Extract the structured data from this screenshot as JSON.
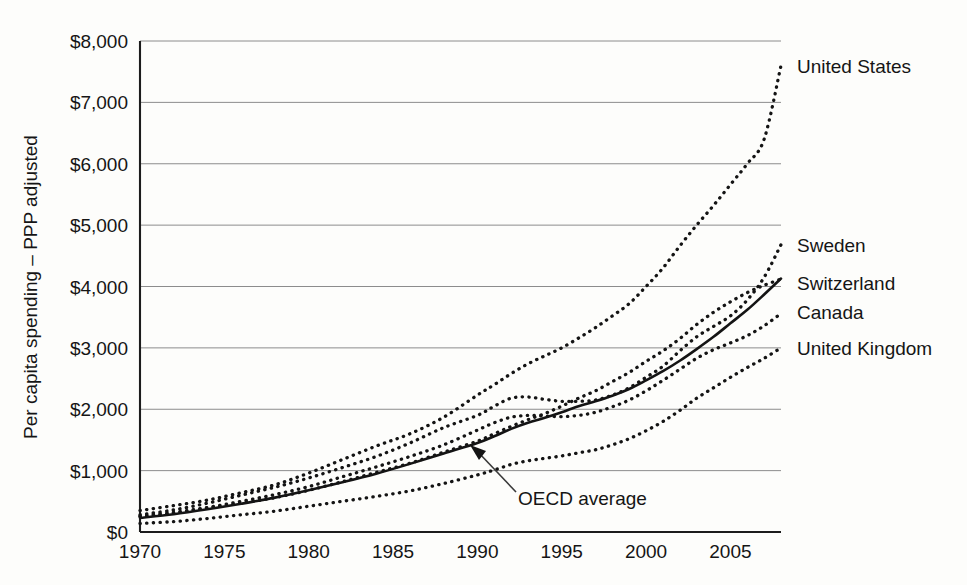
{
  "chart_data": {
    "type": "line",
    "title": "",
    "xlabel": "",
    "ylabel": "Per capita spending – PPP adjusted",
    "xlim": [
      1970,
      2008
    ],
    "ylim": [
      0,
      8000
    ],
    "grid": true,
    "legend_position": "right-inline",
    "y_tick_labels": [
      "$8,000",
      "$7,000",
      "$6,000",
      "$5,000",
      "$4,000",
      "$3,000",
      "$2,000",
      "$1,000",
      "$0"
    ],
    "y_tick_values": [
      8000,
      7000,
      6000,
      5000,
      4000,
      3000,
      2000,
      1000,
      0
    ],
    "x_tick_labels": [
      "1970",
      "1975",
      "1980",
      "1985",
      "1990",
      "1995",
      "2000",
      "2005"
    ],
    "x_tick_values": [
      1970,
      1975,
      1980,
      1985,
      1990,
      1995,
      2000,
      2005
    ],
    "x": [
      1970,
      1972,
      1974,
      1976,
      1978,
      1980,
      1982,
      1984,
      1986,
      1988,
      1990,
      1991,
      1992,
      1993,
      1994,
      1995,
      1996,
      1997,
      1998,
      1999,
      2000,
      2001,
      2002,
      2003,
      2004,
      2005,
      2006,
      2007,
      2008
    ],
    "annotations": [
      {
        "text": "OECD average",
        "x": 1989.2,
        "y": 1380
      }
    ],
    "series": [
      {
        "name": "United States",
        "style": "dotted",
        "label": "United States",
        "label_y": 7590,
        "values": [
          350,
          430,
          520,
          640,
          770,
          960,
          1180,
          1400,
          1600,
          1870,
          2230,
          2400,
          2580,
          2740,
          2870,
          3000,
          3160,
          3330,
          3520,
          3720,
          4000,
          4300,
          4660,
          5000,
          5320,
          5660,
          6000,
          6400,
          7600
        ]
      },
      {
        "name": "Sweden",
        "style": "dotted",
        "label": "Sweden",
        "label_y": 4670,
        "values": [
          280,
          360,
          470,
          600,
          730,
          880,
          1050,
          1230,
          1450,
          1700,
          1900,
          2050,
          2180,
          2200,
          2160,
          2130,
          2130,
          2150,
          2230,
          2350,
          2520,
          2700,
          2950,
          3180,
          3350,
          3520,
          3780,
          4150,
          4680
        ]
      },
      {
        "name": "Switzerland",
        "style": "dotted",
        "label": "Switzerland",
        "label_y": 4050,
        "values": [
          250,
          310,
          390,
          470,
          560,
          680,
          820,
          970,
          1120,
          1300,
          1480,
          1600,
          1720,
          1830,
          1930,
          2050,
          2180,
          2300,
          2450,
          2600,
          2780,
          2950,
          3150,
          3380,
          3580,
          3750,
          3900,
          4020,
          4120
        ]
      },
      {
        "name": "Canada",
        "style": "dotted",
        "label": "Canada",
        "label_y": 3580,
        "values": [
          260,
          320,
          400,
          500,
          610,
          740,
          900,
          1060,
          1230,
          1420,
          1660,
          1780,
          1870,
          1900,
          1890,
          1880,
          1900,
          1950,
          2040,
          2150,
          2300,
          2470,
          2650,
          2830,
          2970,
          3080,
          3200,
          3360,
          3560
        ]
      },
      {
        "name": "United Kingdom",
        "style": "dotted",
        "label": "United Kingdom",
        "label_y": 3000,
        "values": [
          140,
          170,
          220,
          280,
          340,
          420,
          500,
          580,
          670,
          790,
          930,
          1010,
          1100,
          1160,
          1200,
          1240,
          1290,
          1340,
          1420,
          1520,
          1650,
          1800,
          1980,
          2180,
          2350,
          2520,
          2680,
          2830,
          3000
        ]
      },
      {
        "name": "OECD average",
        "style": "solid",
        "label": "",
        "label_y": null,
        "values": [
          230,
          290,
          370,
          460,
          560,
          680,
          810,
          950,
          1110,
          1280,
          1450,
          1560,
          1680,
          1780,
          1860,
          1950,
          2050,
          2130,
          2220,
          2330,
          2470,
          2620,
          2790,
          2980,
          3180,
          3400,
          3620,
          3870,
          4130
        ]
      }
    ]
  }
}
